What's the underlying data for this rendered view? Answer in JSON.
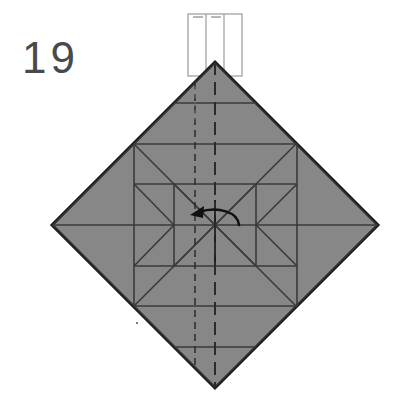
{
  "figure": {
    "title": "",
    "step_label": "19",
    "type": "origami-folding-diagram",
    "canvas": {
      "width": 418,
      "height": 415,
      "background": "#ffffff"
    }
  },
  "colors": {
    "paper_fill": "#878787",
    "paper_outline": "#1a1a1a",
    "crease_line": "#3a3a3a",
    "dashed_line": "#2b2b2b",
    "strip_outline": "#9a9a9a",
    "arrow": "#111111",
    "label_text": "#4a4a4a"
  },
  "shapes": {
    "diamond": {
      "name": "folded-square-paper",
      "center": {
        "x": 215,
        "y": 225
      },
      "half_diagonal": 163,
      "vertices": [
        {
          "x": 215,
          "y": 62
        },
        {
          "x": 378,
          "y": 225
        },
        {
          "x": 215,
          "y": 388
        },
        {
          "x": 52,
          "y": 225
        }
      ],
      "fill": "#878787",
      "stroke": "#1a1a1a",
      "stroke_width": 3
    },
    "top_strip": {
      "name": "raised-paper-strip",
      "x": 188,
      "y": 14,
      "width": 54,
      "height": 62,
      "divider_count": 2,
      "fill": "#ffffff",
      "stroke": "#9a9a9a"
    },
    "arrow": {
      "name": "fold-direction-arrow",
      "direction": "left",
      "style": "curved",
      "start": {
        "x": 238,
        "y": 224
      },
      "end": {
        "x": 193,
        "y": 215
      },
      "color": "#111111"
    }
  },
  "creases": {
    "solid": [
      {
        "name": "horizontal-midline",
        "x1": 52,
        "y1": 225,
        "x2": 378,
        "y2": 225
      },
      {
        "name": "inner-square-top",
        "x1": 134,
        "y1": 144,
        "x2": 297,
        "y2": 144
      },
      {
        "name": "inner-square-bottom",
        "x1": 134,
        "y1": 306,
        "x2": 297,
        "y2": 306
      },
      {
        "name": "inner-square-left",
        "x1": 134,
        "y1": 144,
        "x2": 134,
        "y2": 306
      },
      {
        "name": "inner-square-right",
        "x1": 297,
        "y1": 144,
        "x2": 297,
        "y2": 306
      },
      {
        "name": "core-square-top",
        "x1": 174,
        "y1": 184,
        "x2": 256,
        "y2": 184
      },
      {
        "name": "core-square-bottom",
        "x1": 174,
        "y1": 266,
        "x2": 256,
        "y2": 266
      },
      {
        "name": "core-square-left",
        "x1": 174,
        "y1": 184,
        "x2": 174,
        "y2": 266
      },
      {
        "name": "core-square-right",
        "x1": 256,
        "y1": 184,
        "x2": 256,
        "y2": 266
      },
      {
        "name": "upper-band-line",
        "x1": 174,
        "y1": 103,
        "x2": 256,
        "y2": 103
      },
      {
        "name": "lower-band-line",
        "x1": 174,
        "y1": 347,
        "x2": 256,
        "y2": 347
      },
      {
        "name": "diagonal-nw-se",
        "x1": 97,
        "y1": 107,
        "x2": 333,
        "y2": 343
      },
      {
        "name": "diagonal-ne-sw",
        "x1": 333,
        "y1": 107,
        "x2": 97,
        "y2": 343
      },
      {
        "name": "diag-upper-left-short",
        "x1": 134,
        "y1": 144,
        "x2": 215,
        "y2": 62
      },
      {
        "name": "diag-upper-right-short",
        "x1": 297,
        "y1": 144,
        "x2": 215,
        "y2": 62
      },
      {
        "name": "diag-lower-left-short",
        "x1": 134,
        "y1": 306,
        "x2": 215,
        "y2": 388
      },
      {
        "name": "diag-lower-right-short",
        "x1": 297,
        "y1": 306,
        "x2": 215,
        "y2": 388
      },
      {
        "name": "diag-left-upper",
        "x1": 52,
        "y1": 225,
        "x2": 134,
        "y2": 144
      },
      {
        "name": "diag-left-lower",
        "x1": 52,
        "y1": 225,
        "x2": 134,
        "y2": 306
      },
      {
        "name": "diag-right-upper",
        "x1": 378,
        "y1": 225,
        "x2": 297,
        "y2": 144
      },
      {
        "name": "diag-right-lower",
        "x1": 378,
        "y1": 225,
        "x2": 297,
        "y2": 306
      },
      {
        "name": "x-left-cell-a",
        "x1": 134,
        "y1": 184,
        "x2": 174,
        "y2": 225
      },
      {
        "name": "x-left-cell-b",
        "x1": 134,
        "y1": 266,
        "x2": 174,
        "y2": 225
      },
      {
        "name": "x-right-cell-a",
        "x1": 297,
        "y1": 184,
        "x2": 256,
        "y2": 225
      },
      {
        "name": "x-right-cell-b",
        "x1": 297,
        "y1": 266,
        "x2": 256,
        "y2": 225
      },
      {
        "name": "core-x-a",
        "x1": 174,
        "y1": 184,
        "x2": 256,
        "y2": 266
      },
      {
        "name": "core-x-b",
        "x1": 256,
        "y1": 184,
        "x2": 174,
        "y2": 266
      },
      {
        "name": "flap-edge-vertical",
        "x1": 215,
        "y1": 200,
        "x2": 215,
        "y2": 262
      }
    ],
    "dashed": [
      {
        "name": "center-vertical-fold",
        "x1": 215,
        "y1": 62,
        "x2": 215,
        "y2": 388
      },
      {
        "name": "offset-vertical-fold",
        "x1": 195,
        "y1": 84,
        "x2": 195,
        "y2": 366
      }
    ]
  }
}
